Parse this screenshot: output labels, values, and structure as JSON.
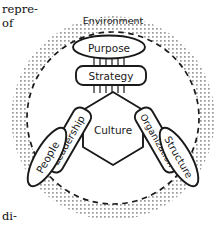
{
  "figure": {
    "type": "concentric-system-diagram",
    "outer_band_label": "Environment",
    "center_label": "Culture",
    "nodes": {
      "purpose": "Purpose",
      "strategy": "Strategy",
      "people": "People",
      "leadership": "Leadership",
      "organization": "Organization",
      "structure": "Structure"
    },
    "colors": {
      "ink": "#1a1a1a",
      "stipple": "#9a9a9a",
      "page": "#ffffff"
    }
  },
  "page_text": {
    "fragment_top_1": "repre-",
    "fragment_top_2": "of",
    "fragment_bottom": "di-"
  }
}
